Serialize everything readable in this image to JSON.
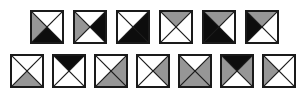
{
  "figure": {
    "title": "",
    "canvas": {
      "width": 305,
      "height": 101,
      "background": "#ffffff"
    },
    "palette": {
      "white": "#ffffff",
      "gray": "#969696",
      "black": "#0d0d0d",
      "outline": "#1a1a1a"
    },
    "tile": {
      "size": 34,
      "stroke_width": 2
    },
    "rows": [
      {
        "name": "row-1",
        "x": 30,
        "y": 10,
        "pitch": 43,
        "tiles": [
          {
            "name": "tile-r1c1",
            "top": "white",
            "right": "white",
            "bottom": "black",
            "left": "gray"
          },
          {
            "name": "tile-r1c2",
            "top": "white",
            "right": "black",
            "bottom": "white",
            "left": "gray"
          },
          {
            "name": "tile-r1c3",
            "top": "white",
            "right": "black",
            "bottom": "black",
            "left": "white"
          },
          {
            "name": "tile-r1c4",
            "top": "gray",
            "right": "white",
            "bottom": "white",
            "left": "white"
          },
          {
            "name": "tile-r1c5",
            "top": "gray",
            "right": "white",
            "bottom": "black",
            "left": "black"
          },
          {
            "name": "tile-r1c6",
            "top": "gray",
            "right": "white",
            "bottom": "white",
            "left": "black"
          }
        ]
      },
      {
        "name": "row-2",
        "x": 10,
        "y": 54,
        "pitch": 42,
        "tiles": [
          {
            "name": "tile-r2c1",
            "top": "white",
            "right": "white",
            "bottom": "gray",
            "left": "white"
          },
          {
            "name": "tile-r2c2",
            "top": "black",
            "right": "white",
            "bottom": "white",
            "left": "white"
          },
          {
            "name": "tile-r2c3",
            "top": "white",
            "right": "gray",
            "bottom": "gray",
            "left": "white"
          },
          {
            "name": "tile-r2c4",
            "top": "white",
            "right": "gray",
            "bottom": "white",
            "left": "white"
          },
          {
            "name": "tile-r2c5",
            "top": "white",
            "right": "gray",
            "bottom": "gray",
            "left": "gray"
          },
          {
            "name": "tile-r2c6",
            "top": "black",
            "right": "gray",
            "bottom": "white",
            "left": "gray"
          },
          {
            "name": "tile-r2c7",
            "top": "white",
            "right": "white",
            "bottom": "white",
            "left": "gray"
          }
        ]
      }
    ]
  }
}
